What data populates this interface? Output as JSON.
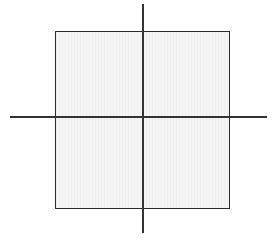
{
  "figure": {
    "kind": "geometric-diagram",
    "background_color": "#ffffff",
    "canvas": {
      "width": 275,
      "height": 240
    }
  },
  "square": {
    "name": "square",
    "fill_color": "#f5f5f5",
    "stroke_color": "#2b2b2b",
    "stroke_width": 1.8,
    "x": 55,
    "y": 31,
    "width": 175,
    "height": 178
  },
  "axes": {
    "stroke_color": "#333333",
    "stroke_width": 1.6,
    "horizontal": {
      "name": "horizontal-axis",
      "x_start": 10,
      "x_end": 267,
      "y": 117
    },
    "vertical": {
      "name": "vertical-axis",
      "x": 143,
      "y_start": 4,
      "y_end": 233
    },
    "intersection": {
      "x": 143,
      "y": 117
    }
  },
  "caption": {
    "text": "",
    "note": "clipped"
  }
}
